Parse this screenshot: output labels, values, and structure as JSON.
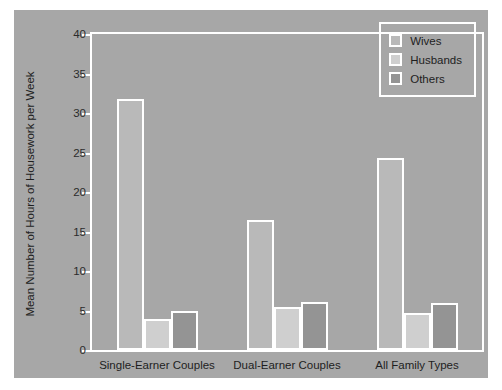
{
  "chart_data": {
    "type": "bar",
    "title": "",
    "xlabel": "",
    "ylabel": "Mean Number of Hours of Housework per Week",
    "ylim": [
      0,
      40
    ],
    "yticks": [
      0,
      5,
      10,
      15,
      20,
      25,
      30,
      35,
      40
    ],
    "ytick_labels": [
      "0",
      "5",
      "10",
      "15",
      "20",
      "25",
      "30",
      "35",
      "40"
    ],
    "grid": false,
    "legend_position": "top-right",
    "categories": [
      "Single-Earner Couples",
      "Dual-Earner Couples",
      "All Family Types"
    ],
    "series": [
      {
        "name": "Wives",
        "color": "#b9b9b9",
        "values": [
          31.8,
          16.4,
          24.3
        ]
      },
      {
        "name": "Husbands",
        "color": "#cfcfcf",
        "values": [
          3.9,
          5.4,
          4.7
        ]
      },
      {
        "name": "Others",
        "color": "#949494",
        "values": [
          5.0,
          6.1,
          5.9
        ]
      }
    ]
  },
  "style": {
    "panel_background": "#a7a7a7",
    "page_background": "#ffffff",
    "axis_color": "#ffffff",
    "text_color": "#1e1e1e"
  }
}
